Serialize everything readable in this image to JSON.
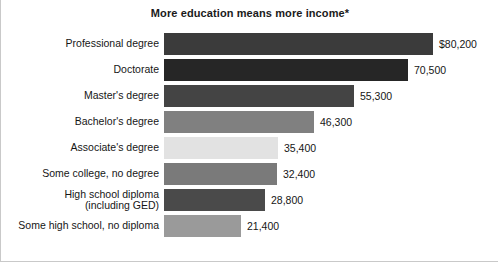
{
  "chart_data": {
    "type": "bar",
    "orientation": "horizontal",
    "title": "More education means more income*",
    "xlabel": "",
    "ylabel": "",
    "grid": false,
    "legend": "none",
    "xlim": [
      0,
      89000
    ],
    "categories": [
      "Professional degree",
      "Doctorate",
      "Master's degree",
      "Bachelor's degree",
      "Associate's degree",
      "Some college, no degree",
      "High school diploma\n(including GED)",
      "Some high school, no diploma"
    ],
    "values": [
      80200,
      70500,
      55300,
      46300,
      35400,
      32400,
      28800,
      21400
    ],
    "value_labels": [
      "$80,200",
      "70,500",
      "55,300",
      "46,300",
      "35,400",
      "32,400",
      "28,800",
      "21,400"
    ],
    "bar_colors": [
      "#3b3b3b",
      "#262626",
      "#444444",
      "#808080",
      "#e2e2e2",
      "#7a7a7a",
      "#4a4a4a",
      "#9a9a9a"
    ],
    "bar_widths_px": [
      269,
      244,
      190,
      150,
      114,
      113,
      101,
      77
    ]
  }
}
